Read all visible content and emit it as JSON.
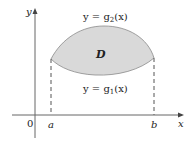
{
  "diagram": {
    "region_label": "D",
    "upper_curve_label": {
      "prefix": "y = g",
      "sub": "2",
      "suffix": "(x)"
    },
    "lower_curve_label": {
      "prefix": "y = g",
      "sub": "1",
      "suffix": "(x)"
    },
    "axes": {
      "x_label": "x",
      "y_label": "y",
      "origin_label": "0"
    },
    "bounds": {
      "left_label": "a",
      "right_label": "b"
    },
    "colors": {
      "region_fill": "#d9d9d9",
      "curve": "#8a8a8a",
      "axis": "#555555",
      "dash": "#555555"
    }
  }
}
